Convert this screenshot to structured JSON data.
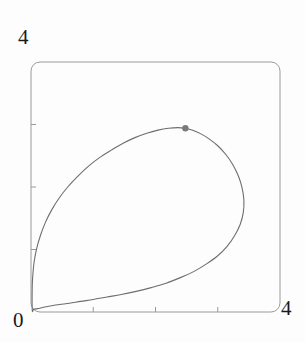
{
  "figure": {
    "name": "parametric-curve-plot",
    "background_color": "#fdfdfd",
    "frame": {
      "stroke_color": "#9a9a9a",
      "x0": 31,
      "y0": 62,
      "x1": 280,
      "y1": 312,
      "corner_radius": 9
    },
    "labels": {
      "y_max": "4",
      "origin": "0",
      "x_max": "4"
    }
  },
  "chart_data": {
    "type": "line",
    "title": "",
    "xlabel": "",
    "ylabel": "",
    "xlim": [
      0,
      4
    ],
    "ylim": [
      0,
      4
    ],
    "grid": false,
    "legend": null,
    "frame_style": "rounded-box",
    "axis_tick_labels": {
      "x": [
        "0",
        "4"
      ],
      "y": [
        "0",
        "4"
      ]
    },
    "x_ticks": [
      1,
      2,
      3
    ],
    "y_ticks": [
      1,
      2,
      3
    ],
    "curve_color": "#6e6e6e",
    "curve_width": 1.1,
    "series": [
      {
        "name": "closed-loop-curve",
        "closed": true,
        "x": [
          0.02,
          0.03,
          0.05,
          0.09,
          0.15,
          0.23,
          0.33,
          0.45,
          0.59,
          0.75,
          0.92,
          1.1,
          1.29,
          1.48,
          1.67,
          1.86,
          2.04,
          2.21,
          2.36,
          2.48,
          2.56,
          2.62,
          2.73,
          2.86,
          3.0,
          3.13,
          3.24,
          3.33,
          3.39,
          3.42,
          3.41,
          3.36,
          3.27,
          3.15,
          3.0,
          2.82,
          2.62,
          2.4,
          2.17,
          1.93,
          1.69,
          1.45,
          1.22,
          1.0,
          0.8,
          0.62,
          0.46,
          0.33,
          0.22,
          0.14,
          0.08,
          0.04,
          0.02
        ],
        "y": [
          0.42,
          0.6,
          0.8,
          1.01,
          1.22,
          1.43,
          1.63,
          1.82,
          2.0,
          2.17,
          2.33,
          2.47,
          2.59,
          2.7,
          2.79,
          2.86,
          2.91,
          2.94,
          2.95,
          2.94,
          2.92,
          2.9,
          2.85,
          2.77,
          2.66,
          2.52,
          2.36,
          2.18,
          1.99,
          1.79,
          1.59,
          1.4,
          1.22,
          1.05,
          0.9,
          0.77,
          0.65,
          0.55,
          0.46,
          0.39,
          0.33,
          0.28,
          0.24,
          0.2,
          0.17,
          0.14,
          0.12,
          0.1,
          0.08,
          0.06,
          0.05,
          0.04,
          0.03
        ]
      }
    ],
    "markers": [
      {
        "name": "highlight-point",
        "x": 2.48,
        "y": 2.94,
        "color": "#7a7a7a",
        "radius": 3.2,
        "shape": "circle"
      }
    ]
  }
}
